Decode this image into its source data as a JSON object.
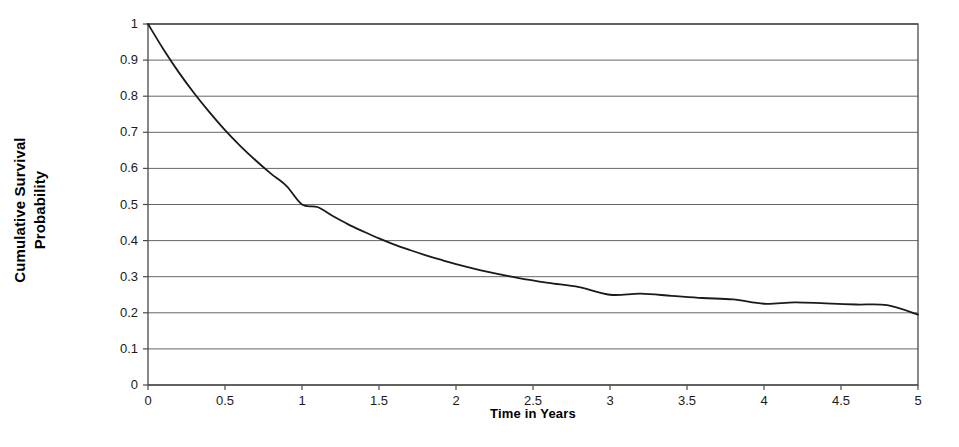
{
  "chart_data": {
    "type": "line",
    "title": "",
    "xlabel": "Time in Years",
    "ylabel": "Cumulative Survival Probability",
    "ylabel_lines": [
      "Cumulative Survival",
      "Probability"
    ],
    "xlim": [
      0,
      5
    ],
    "ylim": [
      0,
      1
    ],
    "grid": "horizontal",
    "legend": "none",
    "x_ticks": [
      "0",
      "0.5",
      "1",
      "1.5",
      "2",
      "2.5",
      "3",
      "3.5",
      "4",
      "4.5",
      "5"
    ],
    "x_tick_values": [
      0,
      0.5,
      1,
      1.5,
      2,
      2.5,
      3,
      3.5,
      4,
      4.5,
      5
    ],
    "y_ticks": [
      "1",
      "0.9",
      "0.8",
      "0.7",
      "0.6",
      "0.5",
      "0.4",
      "0.3",
      "0.2",
      "0.1",
      "0"
    ],
    "y_tick_values": [
      1,
      0.9,
      0.8,
      0.7,
      0.6,
      0.5,
      0.4,
      0.3,
      0.2,
      0.1,
      0
    ],
    "series": [
      {
        "name": "Cumulative survival",
        "color": "#1a1a1a",
        "line_width": 1.8,
        "x": [
          0,
          0.1,
          0.2,
          0.3,
          0.4,
          0.5,
          0.6,
          0.7,
          0.8,
          0.9,
          1.0,
          1.1,
          1.2,
          1.3,
          1.4,
          1.5,
          1.6,
          1.7,
          1.8,
          1.9,
          2.0,
          2.2,
          2.4,
          2.6,
          2.8,
          3.0,
          3.2,
          3.4,
          3.6,
          3.8,
          4.0,
          4.2,
          4.4,
          4.6,
          4.8,
          5.0
        ],
        "y": [
          1.0,
          0.93,
          0.866,
          0.808,
          0.755,
          0.706,
          0.662,
          0.622,
          0.585,
          0.551,
          0.5,
          0.493,
          0.468,
          0.445,
          0.425,
          0.406,
          0.389,
          0.374,
          0.36,
          0.347,
          0.335,
          0.314,
          0.297,
          0.283,
          0.271,
          0.25,
          0.253,
          0.247,
          0.241,
          0.237,
          0.225,
          0.229,
          0.226,
          0.223,
          0.221,
          0.195
        ],
        "annotations": [
          {
            "label": "crosses 0.5",
            "x": 1.0,
            "y": 0.5
          },
          {
            "label": "crosses 0.3",
            "x": 2.06,
            "y": 0.3
          },
          {
            "label": "endpoint",
            "x": 5.0,
            "y": 0.195
          }
        ]
      }
    ]
  },
  "axes": {
    "y_title_line1": "Cumulative Survival",
    "y_title_line2": "Probability",
    "x_title": "Time in Years"
  }
}
